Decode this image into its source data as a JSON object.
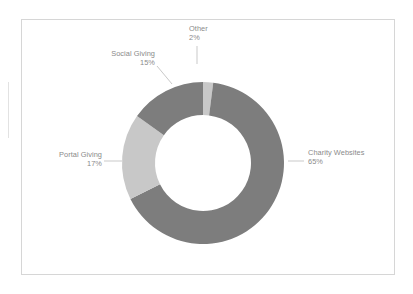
{
  "chart_data": {
    "type": "pie",
    "variant": "donut",
    "title": "",
    "subtitle": "",
    "xlabel": "",
    "ylabel": "",
    "legend": "none",
    "grid": false,
    "labels_show_percent": true,
    "start_angle_deg": 0,
    "direction": "clockwise",
    "categories": [
      "Other",
      "Charity Websites",
      "Portal Giving",
      "Social Giving"
    ],
    "values": [
      2,
      65,
      17,
      15
    ],
    "value_labels": [
      "2%",
      "65%",
      "17%",
      "15%"
    ],
    "colors": [
      "#c8c8c8",
      "#7d7d7d",
      "#c8c8c8",
      "#7d7d7d"
    ],
    "slices": [
      {
        "name": "Other",
        "value": 2,
        "value_label": "2%",
        "color": "#c8c8c8"
      },
      {
        "name": "Charity Websites",
        "value": 65,
        "value_label": "65%",
        "color": "#7d7d7d"
      },
      {
        "name": "Portal Giving",
        "value": 17,
        "value_label": "17%",
        "color": "#c8c8c8"
      },
      {
        "name": "Social Giving",
        "value": 15,
        "value_label": "15%",
        "color": "#7d7d7d"
      }
    ]
  },
  "figure": {
    "background_color": "#ffffff",
    "frame_color": "#d6d6d6",
    "label_color": "#8a8a8a",
    "leader_color": "#c4c4c4",
    "dark_slice_color": "#7d7d7d",
    "light_slice_color": "#c8c8c8"
  }
}
